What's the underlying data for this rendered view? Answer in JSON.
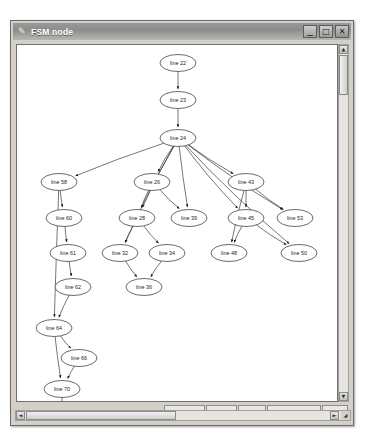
{
  "window": {
    "title": "FSM node",
    "icon": "pencil-icon",
    "controls": {
      "minimize": "minimize-icon",
      "maximize": "maximize-icon",
      "close": "close-icon"
    }
  },
  "toolbar": {
    "buttons": [
      {
        "id": "add-labels",
        "label": "Add Labels"
      },
      {
        "id": "smaller",
        "label": "Smaller"
      },
      {
        "id": "larger",
        "label": "Larger"
      },
      {
        "id": "save",
        "label": "Save in node.ps"
      },
      {
        "id": "close",
        "label": "Close"
      }
    ]
  },
  "scrollbars": {
    "vertical": {
      "up": "▲",
      "down": "▼"
    },
    "horizontal": {
      "left": "◄",
      "right": "►",
      "corner": "◢"
    }
  },
  "graph": {
    "type": "fsm-flow-graph",
    "nodes": [
      {
        "id": "n22",
        "label": "line 22",
        "cx": 161,
        "cy": 18
      },
      {
        "id": "n23",
        "label": "line 23",
        "cx": 161,
        "cy": 55
      },
      {
        "id": "n24",
        "label": "line 24",
        "cx": 161,
        "cy": 93
      },
      {
        "id": "n58",
        "label": "line 58",
        "cx": 42,
        "cy": 137
      },
      {
        "id": "n26",
        "label": "line 26",
        "cx": 135,
        "cy": 137
      },
      {
        "id": "n43",
        "label": "line 43",
        "cx": 229,
        "cy": 137
      },
      {
        "id": "n60",
        "label": "line 60",
        "cx": 47,
        "cy": 173
      },
      {
        "id": "n28",
        "label": "line 28",
        "cx": 120,
        "cy": 173
      },
      {
        "id": "n39",
        "label": "line 39",
        "cx": 172,
        "cy": 173
      },
      {
        "id": "n45",
        "label": "line 45",
        "cx": 229,
        "cy": 173
      },
      {
        "id": "n53",
        "label": "line 53",
        "cx": 278,
        "cy": 173
      },
      {
        "id": "n61",
        "label": "line 61",
        "cx": 51,
        "cy": 208
      },
      {
        "id": "n32",
        "label": "line 32",
        "cx": 103,
        "cy": 208
      },
      {
        "id": "n34",
        "label": "line 34",
        "cx": 150,
        "cy": 208
      },
      {
        "id": "n48",
        "label": "line 48",
        "cx": 212,
        "cy": 208
      },
      {
        "id": "n50",
        "label": "line 50",
        "cx": 282,
        "cy": 208
      },
      {
        "id": "n62",
        "label": "line 62",
        "cx": 56,
        "cy": 242
      },
      {
        "id": "n36",
        "label": "line 36",
        "cx": 127,
        "cy": 242
      },
      {
        "id": "n64",
        "label": "line 64",
        "cx": 37,
        "cy": 283
      },
      {
        "id": "n66",
        "label": "line 66",
        "cx": 62,
        "cy": 313
      },
      {
        "id": "n70",
        "label": "line 70",
        "cx": 45,
        "cy": 344
      },
      {
        "id": "end",
        "label": "end",
        "cx": 45,
        "cy": 383
      }
    ],
    "edges": [
      [
        "n22",
        "n23"
      ],
      [
        "n23",
        "n24"
      ],
      [
        "n24",
        "n58"
      ],
      [
        "n24",
        "n26"
      ],
      [
        "n24",
        "n43"
      ],
      [
        "n24",
        "n28"
      ],
      [
        "n24",
        "n39"
      ],
      [
        "n24",
        "n32"
      ],
      [
        "n24",
        "n45"
      ],
      [
        "n24",
        "n53"
      ],
      [
        "n24",
        "n50"
      ],
      [
        "n58",
        "n60"
      ],
      [
        "n60",
        "n61"
      ],
      [
        "n61",
        "n62"
      ],
      [
        "n58",
        "n64"
      ],
      [
        "n62",
        "n64"
      ],
      [
        "n26",
        "n28"
      ],
      [
        "n26",
        "n39"
      ],
      [
        "n28",
        "n32"
      ],
      [
        "n28",
        "n34"
      ],
      [
        "n32",
        "n36"
      ],
      [
        "n34",
        "n36"
      ],
      [
        "n43",
        "n45"
      ],
      [
        "n43",
        "n53"
      ],
      [
        "n43",
        "n48"
      ],
      [
        "n45",
        "n48"
      ],
      [
        "n45",
        "n50"
      ],
      [
        "n64",
        "n66"
      ],
      [
        "n64",
        "n70"
      ],
      [
        "n66",
        "n70"
      ],
      [
        "n70",
        "end"
      ]
    ]
  }
}
